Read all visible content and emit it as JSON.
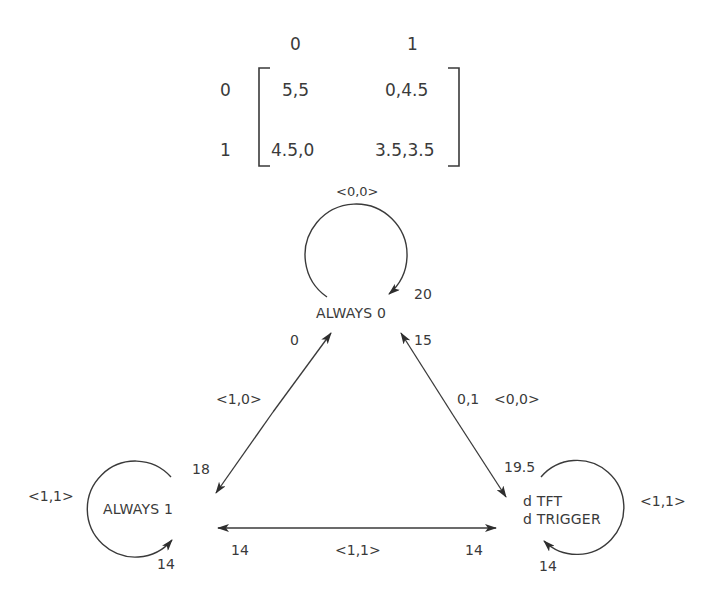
{
  "payoff_matrix": {
    "col_headers": [
      "0",
      "1"
    ],
    "row_headers": [
      "0",
      "1"
    ],
    "cells": [
      [
        "5,5",
        "0,4.5"
      ],
      [
        "4.5,0",
        "3.5,3.5"
      ]
    ]
  },
  "nodes": {
    "always0": {
      "label": "ALWAYS 0",
      "self_loop_action": "<0,0>",
      "self_loop_value": "20"
    },
    "always1": {
      "label": "ALWAYS 1",
      "self_loop_action": "<1,1>",
      "self_loop_value": "14"
    },
    "dtft": {
      "label_line1": "d TFT",
      "label_line2": "d TRIGGER",
      "self_loop_action": "<1,1>",
      "self_loop_value": "14"
    }
  },
  "edges": {
    "always0_always1": {
      "action": "<1,0>",
      "value_at_always0": "0",
      "value_at_always1": "18"
    },
    "always0_dtft": {
      "action": "<0,0>",
      "prob": "0,1",
      "value_at_always0": "15",
      "value_at_dtft": "19.5"
    },
    "always1_dtft": {
      "action": "<1,1>",
      "value_at_always1": "14",
      "value_at_dtft": "14"
    }
  },
  "colors": {
    "ink": "#3a3a3a",
    "background": "#ffffff"
  }
}
